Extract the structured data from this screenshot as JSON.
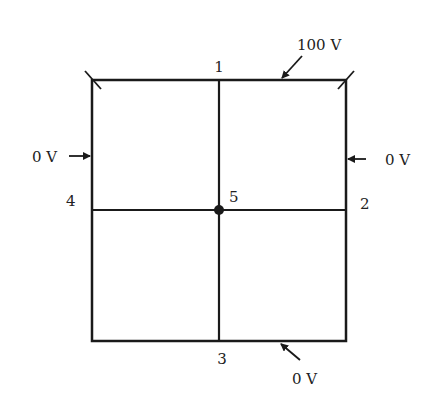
{
  "diagram": {
    "nodes": [
      {
        "id": "1",
        "label": "1",
        "position": "top-middle"
      },
      {
        "id": "2",
        "label": "2",
        "position": "right-middle"
      },
      {
        "id": "3",
        "label": "3",
        "position": "bottom-middle"
      },
      {
        "id": "4",
        "label": "4",
        "position": "left-middle"
      },
      {
        "id": "5",
        "label": "5",
        "position": "center"
      }
    ],
    "boundaries": {
      "top": "100 V",
      "right": "0 V",
      "bottom": "0 V",
      "left": "0 V"
    },
    "line_color": "#1a1a1a"
  }
}
